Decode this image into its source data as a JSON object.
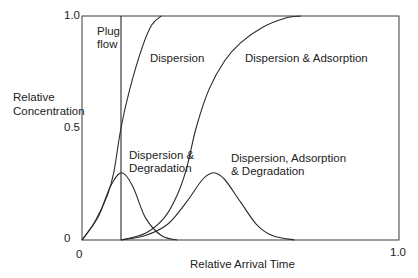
{
  "chart_data": {
    "type": "line",
    "title": "",
    "xlabel": "Relative Arrival Time",
    "ylabel": "Relative Concentration",
    "xlim": [
      0,
      1.0
    ],
    "ylim": [
      0,
      1.0
    ],
    "x_ticks": [
      "0",
      "1.0"
    ],
    "y_ticks": [
      "0",
      "0.5",
      "1.0"
    ],
    "grid": false,
    "legend": "none (inline curve annotations)",
    "series": [
      {
        "name": "Plug flow",
        "kind": "vertical-step",
        "x": [
          0.123,
          0.123
        ],
        "y": [
          0,
          1.0
        ]
      },
      {
        "name": "Dispersion",
        "kind": "breakthrough",
        "x": [
          0,
          0.04,
          0.08,
          0.1,
          0.123,
          0.15,
          0.19,
          0.22,
          0.25
        ],
        "y": [
          0,
          0.08,
          0.2,
          0.3,
          0.5,
          0.67,
          0.86,
          0.96,
          1.0
        ]
      },
      {
        "name": "Dispersion & Adsorption",
        "kind": "breakthrough",
        "x": [
          0.123,
          0.2,
          0.26,
          0.3,
          0.33,
          0.36,
          0.4,
          0.45,
          0.5,
          0.57,
          0.64,
          0.69
        ],
        "y": [
          0,
          0.03,
          0.1,
          0.2,
          0.32,
          0.5,
          0.67,
          0.8,
          0.88,
          0.95,
          0.99,
          1.0
        ]
      },
      {
        "name": "Dispersion & Degradation",
        "kind": "pulse",
        "x": [
          0,
          0.05,
          0.09,
          0.125,
          0.16,
          0.2,
          0.25,
          0.3
        ],
        "y": [
          0,
          0.1,
          0.24,
          0.3,
          0.24,
          0.1,
          0.02,
          0
        ]
      },
      {
        "name": "Dispersion, Adsorption & Degradation",
        "kind": "pulse",
        "x": [
          0.123,
          0.2,
          0.27,
          0.33,
          0.38,
          0.415,
          0.45,
          0.5,
          0.55,
          0.6,
          0.67
        ],
        "y": [
          0,
          0.02,
          0.07,
          0.17,
          0.27,
          0.3,
          0.27,
          0.17,
          0.07,
          0.02,
          0
        ]
      }
    ],
    "annotations": [
      {
        "text": [
          "Plug",
          "flow"
        ],
        "x": 0.04,
        "y": 0.95
      },
      {
        "text": [
          "Dispersion"
        ],
        "x": 0.27,
        "y": 0.86
      },
      {
        "text": [
          "Dispersion & Adsorption"
        ],
        "x": 0.5,
        "y": 0.86
      },
      {
        "text": [
          "Dispersion &",
          "Degradation"
        ],
        "x": 0.15,
        "y": 0.42
      },
      {
        "text": [
          "Dispersion, Adsorption",
          "& Degradation"
        ],
        "x": 0.5,
        "y": 0.42
      }
    ]
  },
  "labels": {
    "ylabel_line1": "Relative",
    "ylabel_line2": "Concentration",
    "xlabel": "Relative Arrival Time",
    "y_top": "1.0",
    "y_mid": "0.5",
    "y_zero": "0",
    "x_zero": "0",
    "x_one": "1.0",
    "plug1": "Plug",
    "plug2": "flow",
    "dispersion": "Dispersion",
    "disp_ads": "Dispersion & Adsorption",
    "disp_deg1": "Dispersion &",
    "disp_deg2": "Degradation",
    "dad1": "Dispersion, Adsorption",
    "dad2": "& Degradation"
  },
  "colors": {
    "line": "#2a2a2a",
    "axis": "#3a3a3a"
  }
}
